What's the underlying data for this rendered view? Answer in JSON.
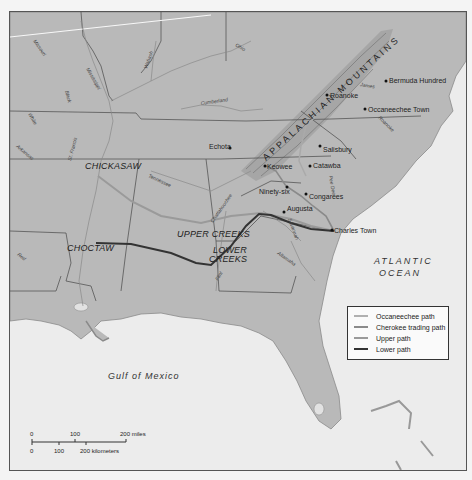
{
  "map": {
    "colors": {
      "land": "#b9b9b9",
      "water": "#ececec",
      "border": "#555555",
      "occaneechee": "#aaaaaa",
      "cherokee": "#8f8f8f",
      "upper": "#9a9a9a",
      "lower": "#3a3a3a"
    },
    "regions": {
      "mountains": "APPALACHIAN MOUNTAINS",
      "atlantic_line1": "ATLANTIC",
      "atlantic_line2": "OCEAN",
      "gulf": "Gulf of Mexico"
    },
    "tribes": {
      "chickasaw": "CHICKASAW",
      "choctaw": "CHOCTAW",
      "upper_creeks": "UPPER CREEKS",
      "lower_creeks_1": "LOWER",
      "lower_creeks_2": "CREEKS"
    },
    "towns": {
      "bermuda_hundred": "Bermuda Hundred",
      "roanoke": "Roanoke",
      "occaneechee_town": "Occaneechee Town",
      "echota": "Echota",
      "salisbury": "Salisbury",
      "keowee": "Keowee",
      "catawba": "Catawba",
      "ninety_six": "Ninety-six",
      "congarees": "Congarees",
      "augusta": "Augusta",
      "charles_town": "Charles Town"
    },
    "rivers": {
      "missouri": "Missouri",
      "mississippi": "Mississippi",
      "wabash": "Wabash",
      "ohio": "Ohio",
      "cumberland": "Cumberland",
      "black": "Black",
      "white": "White",
      "arkansas": "Arkansas",
      "st_francis": "St. Francis",
      "tennessee": "Tennessee",
      "chattahoochee": "Chattahoochee",
      "savannah": "Savannah",
      "altamaha": "Altamaha",
      "flint": "Flint",
      "red": "Red",
      "pee_dee": "Pee Dee",
      "james": "James",
      "roanoke": "Roanoke"
    }
  },
  "legend": {
    "items": [
      {
        "label": "Occaneechee path",
        "color": "#b0b0b0"
      },
      {
        "label": "Cherokee trading path",
        "color": "#8a8a8a"
      },
      {
        "label": "Upper path",
        "color": "#9a9a9a"
      },
      {
        "label": "Lower path",
        "color": "#333333"
      }
    ]
  },
  "scale": {
    "miles_0": "0",
    "miles_100": "100",
    "miles_200": "200 miles",
    "km_0": "0",
    "km_100": "100",
    "km_200": "200 kilometers"
  }
}
